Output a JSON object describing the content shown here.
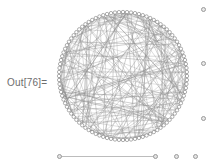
{
  "cell": {
    "out_label": "Out[76]="
  },
  "colors": {
    "background": "#ffffff",
    "label_text": "#6d6d6d",
    "edge": "#8c8c8c",
    "node_stroke": "#7a7a7a",
    "node_fill": "#ffffff",
    "marker_stroke": "#9a9a9a",
    "marker_fill": "#e8e8e8",
    "slider_track": "#bcbcbc"
  },
  "graphics": {
    "name": "circular-graph-plot",
    "layout": "circular-embedding",
    "node_count": 100,
    "edge_count": 220,
    "center_x": 68,
    "center_y": 74,
    "radius": 64,
    "node_radius": 1.7,
    "edge_width": 0.45,
    "random_seed": 76
  },
  "bracket_markers": [
    {
      "name": "cell-bracket-dot-top",
      "label": ""
    },
    {
      "name": "cell-bracket-dot-middle",
      "label": ""
    },
    {
      "name": "cell-bracket-dot-bottom",
      "label": ""
    }
  ],
  "slider": {
    "name": "graph-slider",
    "handle_left_label": "",
    "handle_right_label": "",
    "extra_dot_1_label": "",
    "extra_dot_2_label": ""
  }
}
